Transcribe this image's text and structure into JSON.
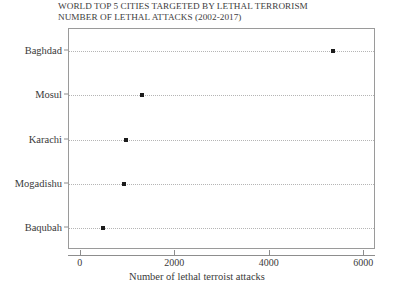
{
  "chart_data": {
    "type": "scatter",
    "title": "WORLD TOP 5 CITIES TARGETED BY LETHAL TERRORISM",
    "subtitle": "NUMBER OF LETHAL ATTACKS (2002-2017)",
    "title_lines": [
      "WORLD TOP 5 CITIES TARGETED BY LETHAL TERRORISM",
      "NUMBER OF LETHAL ATTACKS (2002-2017)"
    ],
    "orientation": "horizontal",
    "categories": [
      "Baghdad",
      "Mosul",
      "Karachi",
      "Mogadishu",
      "Baqubah"
    ],
    "values": [
      5330,
      1290,
      960,
      920,
      460
    ],
    "points": [
      {
        "category": "Baghdad",
        "value": 5330
      },
      {
        "category": "Mosul",
        "value": 1290
      },
      {
        "category": "Karachi",
        "value": 960
      },
      {
        "category": "Mogadishu",
        "value": 920
      },
      {
        "category": "Baqubah",
        "value": 460
      }
    ],
    "xlabel": "Number of lethal terroist attacks",
    "ylabel": "",
    "xlim": [
      -250,
      6250
    ],
    "xticks": [
      0,
      2000,
      4000,
      6000
    ],
    "xtick_labels": [
      "0",
      "2000",
      "4000",
      "6000"
    ],
    "grid": true,
    "grid_style": "dotted-horizontal",
    "legend": null,
    "marker": "square",
    "marker_color": "#1c1c1c",
    "grid_color": "#b5b5b5",
    "frame_color": "#9a9a9a",
    "background": "#ffffff"
  }
}
